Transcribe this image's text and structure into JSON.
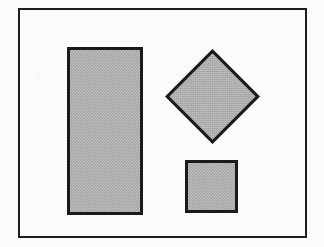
{
  "figure": {
    "canvas": {
      "width": 324,
      "height": 247,
      "background_color": "#fbfbfa"
    },
    "frame": {
      "name": "border-frame",
      "x": 18,
      "y": 8,
      "width": 289,
      "height": 230,
      "stroke_color": "#1d1d1d",
      "stroke_width": 2,
      "fill": "none"
    },
    "fill_color": "#a5a5a5",
    "stroke_color": "#1a1a1a",
    "stroke_width": 3,
    "shapes": [
      {
        "id": "rectangle",
        "label": "tall rectangle",
        "type": "rectangle",
        "x": 67,
        "y": 47,
        "width": 76,
        "height": 168,
        "rotation": 0,
        "fill_color": "#a5a5a5",
        "stroke_color": "#1a1a1a",
        "stroke_width": 3
      },
      {
        "id": "diamond",
        "label": "diamond",
        "type": "square-rotated",
        "center_x": 212,
        "center_y": 96,
        "side": 67,
        "rotation": 45,
        "fill_color": "#a5a5a5",
        "stroke_color": "#1a1a1a",
        "stroke_width": 3
      },
      {
        "id": "square",
        "label": "small square",
        "type": "square",
        "x": 185,
        "y": 160,
        "width": 53,
        "height": 53,
        "rotation": 0,
        "fill_color": "#a5a5a5",
        "stroke_color": "#1a1a1a",
        "stroke_width": 3
      }
    ],
    "shape_count": 3
  }
}
